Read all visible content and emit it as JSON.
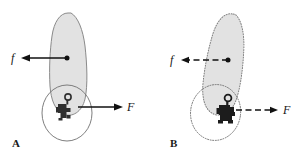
{
  "figure": {
    "background_color": "#ffffff",
    "width": 307,
    "height": 156
  },
  "panels": [
    {
      "id": "A",
      "label": "A",
      "outline_style": "solid",
      "body_fill_color": "#e2e2e2",
      "body_stroke_color": "#8a8a8a",
      "forces": [
        {
          "name": "f",
          "label": "f",
          "direction": "left",
          "line_style": "solid",
          "applied_to": "body",
          "label_color": "#141414"
        },
        {
          "name": "F",
          "label": "F",
          "direction": "right",
          "line_style": "solid",
          "applied_to": "rider",
          "label_color": "#141414"
        }
      ],
      "rider": {
        "name": "rider-figure",
        "color": "#2f2f2f"
      }
    },
    {
      "id": "B",
      "label": "B",
      "outline_style": "dotted",
      "body_fill_color": "#e2e2e2",
      "body_stroke_color": "#7d7d7d",
      "forces": [
        {
          "name": "f",
          "label": "f",
          "direction": "left",
          "line_style": "dashed",
          "applied_to": "body",
          "label_color": "#141414"
        },
        {
          "name": "F",
          "label": "F",
          "direction": "right",
          "line_style": "dashed",
          "applied_to": "rider",
          "label_color": "#141414"
        }
      ],
      "rider": {
        "name": "rider-figure",
        "color": "#1c1c1c"
      }
    }
  ]
}
